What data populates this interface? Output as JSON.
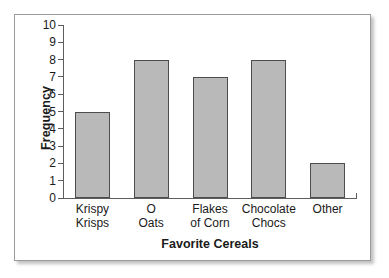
{
  "chart_data": {
    "type": "bar",
    "title": "",
    "xlabel": "Favorite Cereals",
    "ylabel": "Frequency",
    "categories": [
      "Krispy\nKrisps",
      "O\nOats",
      "Flakes\nof Corn",
      "Chocolate\nChocs",
      "Other"
    ],
    "values": [
      5,
      8,
      7,
      8,
      2
    ],
    "ylim": [
      0,
      10
    ],
    "yticks": [
      0,
      1,
      2,
      3,
      4,
      5,
      6,
      7,
      8,
      9,
      10
    ],
    "ytick_labels": [
      "0",
      "1",
      "2",
      "3",
      "4",
      "5",
      "6",
      "7",
      "8",
      "9",
      "10"
    ],
    "grid": false,
    "legend": false,
    "bar_fill_color": "#b9b9b9",
    "bar_edge_color": "#4d4d4d",
    "axis_color": "#5d5d5d",
    "background_color": "#ffffff",
    "border_color": "#9a9a9a"
  }
}
